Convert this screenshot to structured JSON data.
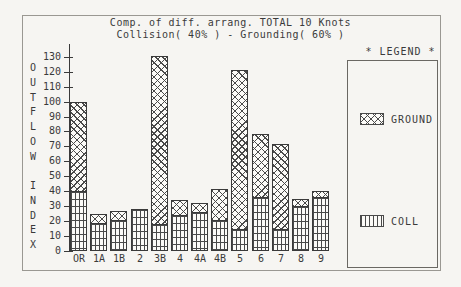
{
  "title_line1": "Comp. of diff. arrang. TOTAL 10 Knots",
  "title_line2": "Collision( 40% ) - Grounding( 60% )",
  "legend": {
    "header": "* LEGEND *",
    "items": [
      {
        "label": "GROUND",
        "pattern": "diagonal-crosshatch"
      },
      {
        "label": "COLL",
        "pattern": "vertical-lines"
      }
    ]
  },
  "chart_data": {
    "type": "bar",
    "stacked": true,
    "title": "Comp. of diff. arrang. TOTAL 10 Knots",
    "subtitle": "Collision( 40% ) - Grounding( 60% )",
    "ylabel": "OUTFLOW INDEX",
    "xlabel": "",
    "ylim": [
      0,
      130
    ],
    "ytick_step": 10,
    "grid": false,
    "legend_position": "right",
    "categories": [
      "OR",
      "1A",
      "1B",
      "2",
      "3B",
      "4",
      "4A",
      "4B",
      "5",
      "6",
      "7",
      "8",
      "9"
    ],
    "series": [
      {
        "name": "COLL",
        "values": [
          40,
          19,
          21,
          28,
          18,
          24,
          26,
          21,
          15,
          36,
          15,
          30,
          36
        ]
      },
      {
        "name": "GROUND",
        "values": [
          60,
          6,
          6,
          0,
          113,
          10,
          6,
          21,
          107,
          42,
          57,
          5,
          4
        ]
      }
    ],
    "totals": [
      100,
      25,
      27,
      28,
      131,
      34,
      32,
      42,
      122,
      78,
      72,
      35,
      40
    ]
  },
  "colors": {
    "line": "#3a3a3a",
    "frame": "#9a9892",
    "background": "#f6f5f2",
    "bar_fill": "#fcfbf8"
  }
}
